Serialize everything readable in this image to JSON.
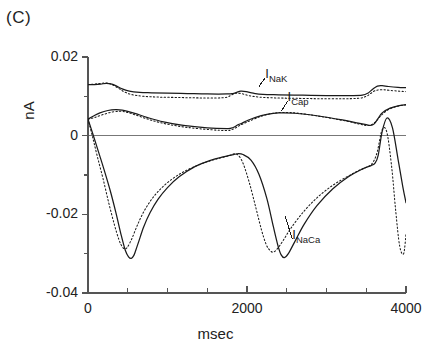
{
  "figure": {
    "panel_label": "(C)",
    "axis_color": "#555555",
    "trace_color": "#1a1a1a",
    "background": "#ffffff"
  },
  "labels": {
    "inak": "I",
    "inak_sub": "NaK",
    "icap": "I",
    "icap_sub": "Cap",
    "inaca": "I",
    "inaca_sub": "NaCa"
  },
  "chart_data": {
    "type": "line",
    "title": "(C)",
    "xlabel": "msec",
    "ylabel": "nA",
    "xlim": [
      0,
      4000
    ],
    "ylim": [
      -0.04,
      0.02
    ],
    "grid": false,
    "legend": "inline-annotations",
    "xticks": [
      0,
      2000,
      4000
    ],
    "xtick_labels": [
      "0",
      "2000",
      "4000"
    ],
    "xminor_ticks": [
      500,
      1000,
      1500,
      2500,
      3000,
      3500
    ],
    "yticks": [
      0.02,
      0,
      -0.02,
      -0.04
    ],
    "ytick_labels": [
      "0.02",
      "0",
      "-0.02",
      "-0.04"
    ],
    "yminor_ticks": [
      0.01,
      -0.01,
      -0.03
    ],
    "zero_line": 0,
    "annotations": [
      {
        "text": "I_NaK",
        "x": 2280,
        "y": 0.0155,
        "leader_to_x": 2150,
        "leader_to_y": 0.0125
      },
      {
        "text": "I_Cap",
        "x": 2560,
        "y": 0.0095,
        "leader_to_x": 2430,
        "leader_to_y": 0.0062
      },
      {
        "text": "I_NaCa",
        "x": 2620,
        "y": -0.0255,
        "leader_to_x": 2480,
        "leader_to_y": -0.0205
      }
    ],
    "series": [
      {
        "name": "I_NaK (solid)",
        "style": "solid",
        "x": [
          0,
          80,
          160,
          230,
          300,
          360,
          430,
          520,
          650,
          800,
          1000,
          1250,
          1500,
          1750,
          1820,
          1870,
          1920,
          1990,
          2080,
          2200,
          2400,
          2700,
          3000,
          3300,
          3450,
          3520,
          3580,
          3640,
          3700,
          3780,
          3900,
          4000
        ],
        "y": [
          0.013,
          0.013,
          0.0131,
          0.0133,
          0.0131,
          0.0126,
          0.0119,
          0.0113,
          0.011,
          0.0109,
          0.0108,
          0.0107,
          0.0106,
          0.0106,
          0.0107,
          0.011,
          0.0113,
          0.0112,
          0.0108,
          0.0105,
          0.0104,
          0.0103,
          0.0102,
          0.0102,
          0.0103,
          0.0108,
          0.0118,
          0.0126,
          0.0127,
          0.0125,
          0.0123,
          0.0122
        ]
      },
      {
        "name": "I_NaK (dotted)",
        "style": "dotted",
        "x": [
          0,
          80,
          160,
          230,
          300,
          380,
          460,
          560,
          700,
          900,
          1150,
          1400,
          1650,
          1750,
          1800,
          1860,
          1930,
          2020,
          2150,
          2350,
          2600,
          2900,
          3200,
          3400,
          3500,
          3560,
          3620,
          3700,
          3800,
          3920,
          4000
        ],
        "y": [
          0.013,
          0.0131,
          0.0133,
          0.0134,
          0.013,
          0.0121,
          0.0111,
          0.0104,
          0.01,
          0.0098,
          0.0097,
          0.0096,
          0.0096,
          0.0098,
          0.0103,
          0.0108,
          0.0107,
          0.0102,
          0.0098,
          0.0096,
          0.0095,
          0.0094,
          0.0094,
          0.0095,
          0.01,
          0.0108,
          0.0115,
          0.0117,
          0.0115,
          0.0113,
          0.0112
        ]
      },
      {
        "name": "I_Cap (solid)",
        "style": "solid",
        "x": [
          0,
          70,
          150,
          250,
          350,
          430,
          500,
          600,
          750,
          950,
          1200,
          1500,
          1750,
          1800,
          1840,
          1880,
          1940,
          2000,
          2100,
          2250,
          2400,
          2600,
          2900,
          3200,
          3400,
          3500,
          3550,
          3600,
          3650,
          3700,
          3800,
          3900,
          4000
        ],
        "y": [
          0.0042,
          0.005,
          0.0058,
          0.0064,
          0.0066,
          0.0065,
          0.0062,
          0.0056,
          0.0046,
          0.0035,
          0.0026,
          0.002,
          0.0018,
          0.0019,
          0.0022,
          0.0027,
          0.0032,
          0.0038,
          0.0046,
          0.0054,
          0.0058,
          0.0057,
          0.005,
          0.004,
          0.0032,
          0.0028,
          0.0026,
          0.003,
          0.0044,
          0.0058,
          0.007,
          0.0076,
          0.0079
        ]
      },
      {
        "name": "I_Cap (dotted)",
        "style": "dotted",
        "x": [
          0,
          80,
          180,
          300,
          400,
          480,
          550,
          650,
          800,
          1000,
          1250,
          1550,
          1750,
          1800,
          1850,
          1900,
          1960,
          2040,
          2160,
          2300,
          2450,
          2650,
          2950,
          3250,
          3420,
          3500,
          3560,
          3620,
          3680,
          3760,
          3860,
          3950,
          4000
        ],
        "y": [
          0.0042,
          0.0046,
          0.0053,
          0.006,
          0.0062,
          0.006,
          0.0056,
          0.0049,
          0.0039,
          0.0029,
          0.0021,
          0.0015,
          0.0013,
          0.0015,
          0.0019,
          0.0025,
          0.0031,
          0.0038,
          0.0048,
          0.0056,
          0.0059,
          0.0057,
          0.0048,
          0.0037,
          0.0029,
          0.0026,
          0.0027,
          0.0036,
          0.005,
          0.0064,
          0.0073,
          0.0077,
          0.0078
        ]
      },
      {
        "name": "I_NaCa (solid)",
        "style": "solid",
        "x": [
          0,
          60,
          130,
          200,
          280,
          350,
          420,
          470,
          510,
          545,
          575,
          600,
          640,
          700,
          780,
          880,
          1000,
          1150,
          1350,
          1550,
          1700,
          1780,
          1830,
          1880,
          1950,
          2050,
          2150,
          2250,
          2330,
          2390,
          2430,
          2470,
          2520,
          2600,
          2720,
          2880,
          3080,
          3280,
          3450,
          3560,
          3610,
          3650,
          3700,
          3760,
          3830,
          3900,
          3960,
          4000
        ],
        "y": [
          0.0042,
          0.0005,
          -0.004,
          -0.0085,
          -0.014,
          -0.0195,
          -0.0255,
          -0.0292,
          -0.0308,
          -0.0312,
          -0.0305,
          -0.0292,
          -0.0268,
          -0.0232,
          -0.0196,
          -0.0162,
          -0.0132,
          -0.0104,
          -0.0078,
          -0.0062,
          -0.0054,
          -0.005,
          -0.0048,
          -0.0046,
          -0.0048,
          -0.0062,
          -0.0098,
          -0.016,
          -0.023,
          -0.028,
          -0.0303,
          -0.031,
          -0.03,
          -0.027,
          -0.0225,
          -0.0178,
          -0.0135,
          -0.0104,
          -0.0085,
          -0.0076,
          -0.007,
          -0.005,
          0.001,
          0.0045,
          0.002,
          -0.006,
          -0.013,
          -0.017
        ]
      },
      {
        "name": "I_NaCa (dotted)",
        "style": "dotted",
        "x": [
          0,
          60,
          120,
          190,
          260,
          330,
          390,
          430,
          460,
          490,
          520,
          560,
          620,
          700,
          800,
          920,
          1060,
          1220,
          1420,
          1600,
          1720,
          1790,
          1840,
          1890,
          1950,
          2030,
          2110,
          2180,
          2240,
          2290,
          2330,
          2380,
          2450,
          2550,
          2700,
          2880,
          3080,
          3280,
          3430,
          3530,
          3590,
          3640,
          3700,
          3760,
          3820,
          3870,
          3920,
          3970,
          4000
        ],
        "y": [
          0.0042,
          -0.0005,
          -0.0055,
          -0.011,
          -0.017,
          -0.0225,
          -0.0265,
          -0.0282,
          -0.0288,
          -0.0285,
          -0.0275,
          -0.0258,
          -0.0228,
          -0.0194,
          -0.0162,
          -0.0134,
          -0.011,
          -0.009,
          -0.0072,
          -0.006,
          -0.0054,
          -0.005,
          -0.0046,
          -0.005,
          -0.007,
          -0.012,
          -0.0182,
          -0.0238,
          -0.0276,
          -0.0292,
          -0.0296,
          -0.0288,
          -0.0268,
          -0.0236,
          -0.0196,
          -0.0158,
          -0.0126,
          -0.0102,
          -0.0086,
          -0.0078,
          -0.0066,
          -0.004,
          0.0015,
          0.0008,
          -0.008,
          -0.019,
          -0.028,
          -0.03,
          -0.025
        ]
      }
    ]
  }
}
